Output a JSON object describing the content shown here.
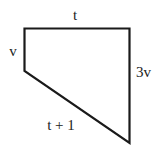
{
  "diagram": {
    "type": "quadrilateral",
    "stroke_color": "#1a1a1a",
    "fill_color": "#ffffff",
    "vertices": [
      [
        24.5,
        28.5
      ],
      [
        129.5,
        28.5
      ],
      [
        129.5,
        143
      ],
      [
        24.5,
        71
      ]
    ],
    "labels": {
      "top": "t",
      "left": "v",
      "right": "3v",
      "bottom": "t + 1"
    }
  }
}
